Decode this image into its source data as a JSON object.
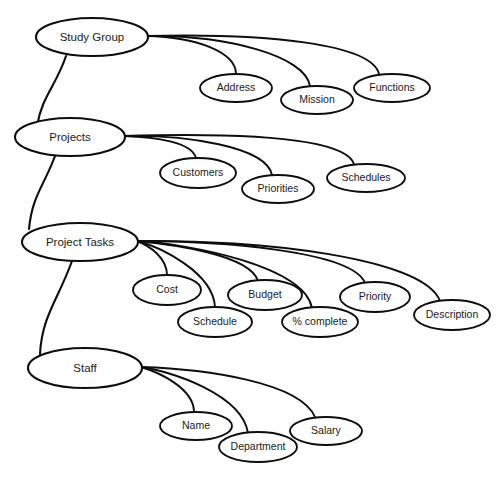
{
  "diagram": {
    "type": "entity-attribute-hierarchy",
    "title": "",
    "background_color": "#ffffff",
    "line_color": "#0d0d0d",
    "text_color": "#1a1a1a",
    "entities": [
      {
        "id": "study-group",
        "label": "Study  Group",
        "cx": 92,
        "cy": 37,
        "rx": 56,
        "ry": 19,
        "stroke_width": 2.1,
        "font_size": 12,
        "attach_x": 147,
        "attach_y": 36,
        "attributes": [
          {
            "id": "address",
            "label": "Address",
            "cx": 236,
            "cy": 88,
            "rx": 36,
            "ry": 14,
            "stroke_width": 1.9,
            "font_size": 10.5,
            "enter_x": 236,
            "enter_y": 74,
            "ctrl1_x": 196,
            "ctrl1_y": 37,
            "ctrl2_x": 236,
            "ctrl2_y": 52
          },
          {
            "id": "mission",
            "label": "Mission",
            "cx": 317,
            "cy": 100,
            "rx": 36,
            "ry": 14,
            "stroke_width": 1.9,
            "font_size": 10.5,
            "enter_x": 310,
            "enter_y": 86,
            "ctrl1_x": 228,
            "ctrl1_y": 35,
            "ctrl2_x": 305,
            "ctrl2_y": 56
          },
          {
            "id": "functions",
            "label": "Functions",
            "cx": 392,
            "cy": 88,
            "rx": 38,
            "ry": 14,
            "stroke_width": 1.9,
            "font_size": 10.5,
            "enter_x": 379,
            "enter_y": 74,
            "ctrl1_x": 268,
            "ctrl1_y": 33,
            "ctrl2_x": 372,
            "ctrl2_y": 44
          }
        ]
      },
      {
        "id": "projects",
        "label": "Projects",
        "cx": 70,
        "cy": 137,
        "rx": 55,
        "ry": 19,
        "stroke_width": 2.1,
        "font_size": 12,
        "attach_x": 124,
        "attach_y": 136,
        "attributes": [
          {
            "id": "customers",
            "label": "Customers",
            "cx": 198,
            "cy": 173,
            "rx": 38,
            "ry": 15,
            "stroke_width": 1.9,
            "font_size": 10.5,
            "enter_x": 196,
            "enter_y": 158,
            "ctrl1_x": 155,
            "ctrl1_y": 137,
            "ctrl2_x": 192,
            "ctrl2_y": 142
          },
          {
            "id": "priorities",
            "label": "Priorities",
            "cx": 278,
            "cy": 189,
            "rx": 36,
            "ry": 14,
            "stroke_width": 1.9,
            "font_size": 10.5,
            "enter_x": 272,
            "enter_y": 175,
            "ctrl1_x": 185,
            "ctrl1_y": 135,
            "ctrl2_x": 266,
            "ctrl2_y": 146
          },
          {
            "id": "schedules",
            "label": "Schedules",
            "cx": 366,
            "cy": 178,
            "rx": 39,
            "ry": 14,
            "stroke_width": 1.9,
            "font_size": 10.5,
            "enter_x": 354,
            "enter_y": 164,
            "ctrl1_x": 230,
            "ctrl1_y": 133,
            "ctrl2_x": 344,
            "ctrl2_y": 136
          }
        ]
      },
      {
        "id": "project-tasks",
        "label": "Project Tasks",
        "cx": 80,
        "cy": 242,
        "rx": 58,
        "ry": 19,
        "stroke_width": 2.1,
        "font_size": 12,
        "attach_x": 137,
        "attach_y": 241,
        "attributes": [
          {
            "id": "cost",
            "label": "Cost",
            "cx": 167,
            "cy": 290,
            "rx": 34,
            "ry": 15,
            "stroke_width": 1.9,
            "font_size": 10.5,
            "enter_x": 167,
            "enter_y": 275,
            "ctrl1_x": 150,
            "ctrl1_y": 246,
            "ctrl2_x": 167,
            "ctrl2_y": 258
          },
          {
            "id": "schedule",
            "label": "Schedule",
            "cx": 215,
            "cy": 322,
            "rx": 37,
            "ry": 15,
            "stroke_width": 1.9,
            "font_size": 10.5,
            "enter_x": 215,
            "enter_y": 307,
            "ctrl1_x": 160,
            "ctrl1_y": 247,
            "ctrl2_x": 213,
            "ctrl2_y": 272
          },
          {
            "id": "budget",
            "label": "Budget",
            "cx": 265,
            "cy": 295,
            "rx": 37,
            "ry": 15,
            "stroke_width": 1.9,
            "font_size": 10.5,
            "enter_x": 258,
            "enter_y": 281,
            "ctrl1_x": 168,
            "ctrl1_y": 244,
            "ctrl2_x": 250,
            "ctrl2_y": 254
          },
          {
            "id": "percent-complete",
            "label": "%  complete",
            "cx": 320,
            "cy": 322,
            "rx": 38,
            "ry": 15,
            "stroke_width": 1.9,
            "font_size": 10.5,
            "enter_x": 312,
            "enter_y": 308,
            "ctrl1_x": 190,
            "ctrl1_y": 244,
            "ctrl2_x": 304,
            "ctrl2_y": 266
          },
          {
            "id": "priority",
            "label": "Priority",
            "cx": 375,
            "cy": 297,
            "rx": 35,
            "ry": 15,
            "stroke_width": 1.9,
            "font_size": 10.5,
            "enter_x": 365,
            "enter_y": 283,
            "ctrl1_x": 215,
            "ctrl1_y": 241,
            "ctrl2_x": 352,
            "ctrl2_y": 250
          },
          {
            "id": "description",
            "label": "Description",
            "cx": 452,
            "cy": 315,
            "rx": 38,
            "ry": 15,
            "stroke_width": 1.9,
            "font_size": 10.5,
            "enter_x": 440,
            "enter_y": 301,
            "ctrl1_x": 260,
            "ctrl1_y": 239,
            "ctrl2_x": 424,
            "ctrl2_y": 258
          }
        ]
      },
      {
        "id": "staff",
        "label": "Staff",
        "cx": 85,
        "cy": 368,
        "rx": 57,
        "ry": 20,
        "stroke_width": 2.1,
        "font_size": 12,
        "attach_x": 141,
        "attach_y": 367,
        "attributes": [
          {
            "id": "name",
            "label": "Name",
            "cx": 196,
            "cy": 426,
            "rx": 36,
            "ry": 14,
            "stroke_width": 1.9,
            "font_size": 10.5,
            "enter_x": 194,
            "enter_y": 412,
            "ctrl1_x": 158,
            "ctrl1_y": 372,
            "ctrl2_x": 194,
            "ctrl2_y": 388
          },
          {
            "id": "department",
            "label": "Department",
            "cx": 258,
            "cy": 447,
            "rx": 39,
            "ry": 15,
            "stroke_width": 1.9,
            "font_size": 10.5,
            "enter_x": 248,
            "enter_y": 433,
            "ctrl1_x": 170,
            "ctrl1_y": 371,
            "ctrl2_x": 242,
            "ctrl2_y": 394
          },
          {
            "id": "salary",
            "label": "Salary",
            "cx": 326,
            "cy": 431,
            "rx": 36,
            "ry": 14,
            "stroke_width": 1.9,
            "font_size": 10.5,
            "enter_x": 315,
            "enter_y": 417,
            "ctrl1_x": 205,
            "ctrl1_y": 369,
            "ctrl2_x": 300,
            "ctrl2_y": 382
          }
        ]
      }
    ],
    "spine_links": [
      {
        "id": "study-group-to-projects",
        "from": "study-group",
        "to": "projects",
        "start_x": 66,
        "start_y": 56,
        "ctrl1_x": 56,
        "ctrl1_y": 86,
        "ctrl2_x": 42,
        "ctrl2_y": 96,
        "end_x": 37,
        "end_y": 126,
        "stroke_width": 2.1
      },
      {
        "id": "projects-to-project-tasks",
        "from": "projects",
        "to": "project-tasks",
        "start_x": 55,
        "start_y": 156,
        "ctrl1_x": 44,
        "ctrl1_y": 186,
        "ctrl2_x": 32,
        "ctrl2_y": 196,
        "end_x": 29,
        "end_y": 229,
        "stroke_width": 2.1
      },
      {
        "id": "project-tasks-to-staff",
        "from": "project-tasks",
        "to": "staff",
        "start_x": 72,
        "start_y": 261,
        "ctrl1_x": 58,
        "ctrl1_y": 300,
        "ctrl2_x": 42,
        "ctrl2_y": 316,
        "end_x": 40,
        "end_y": 354,
        "stroke_width": 2.1
      }
    ]
  }
}
